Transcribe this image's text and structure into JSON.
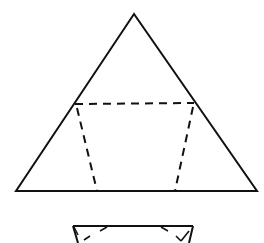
{
  "diagram": {
    "colors": {
      "background": "#ffffff",
      "stroke": "#111111"
    },
    "triangle": {
      "apex": [
        134,
        14
      ],
      "bottom_left": [
        16,
        191
      ],
      "bottom_right": [
        257,
        191
      ]
    },
    "dashed_trapezoid": {
      "top_left": [
        75,
        104
      ],
      "top_right": [
        194,
        103
      ],
      "bottom_left": [
        97,
        191
      ],
      "bottom_right": [
        175,
        191
      ]
    },
    "folded_shape_partial": {
      "top_left": [
        73,
        226
      ],
      "top_right": [
        193,
        226
      ]
    }
  }
}
